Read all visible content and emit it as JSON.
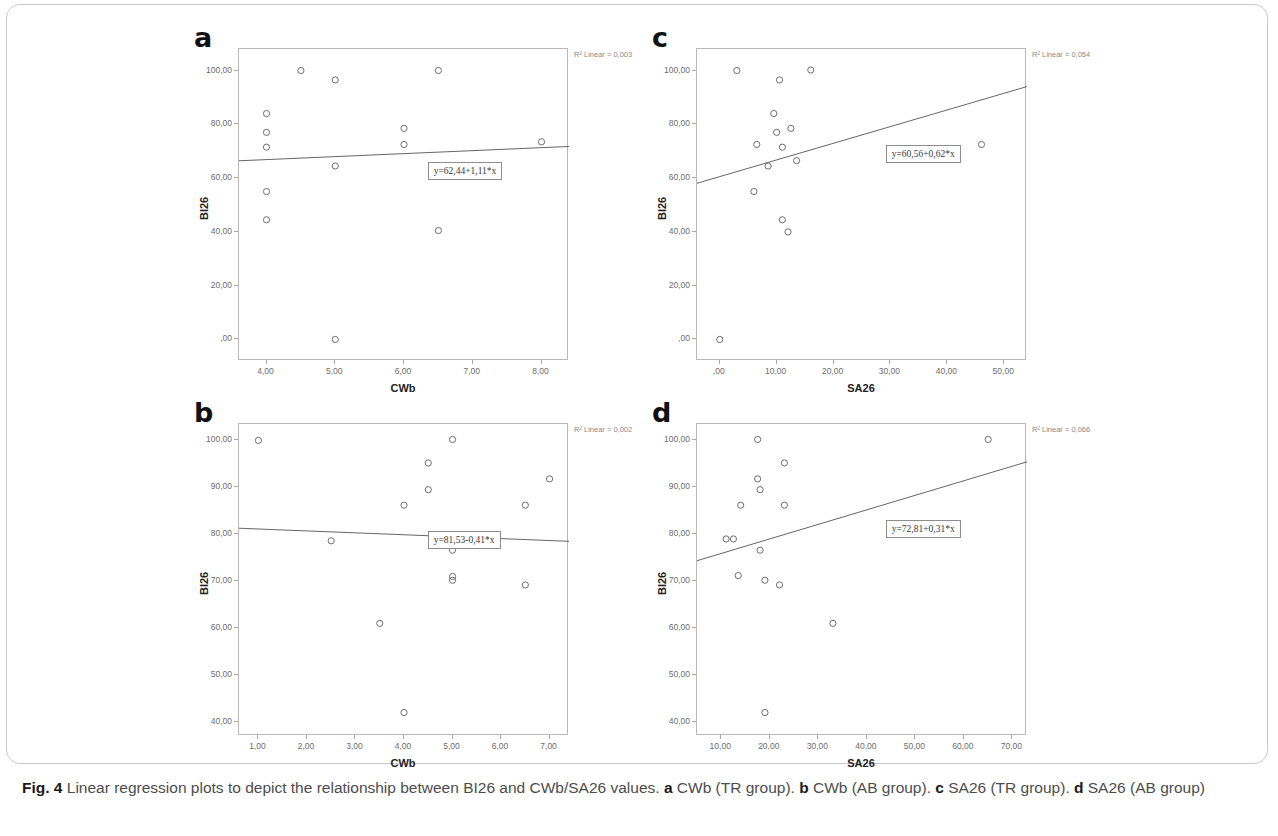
{
  "figure": {
    "label": "Fig. 4",
    "caption_main": "Linear regression plots to depict the relationship between BI26 and CWb/SA26 values.",
    "caption_parts": [
      {
        "letter": "a",
        "text": "CWb (TR group)."
      },
      {
        "letter": "b",
        "text": "CWb (AB group)."
      },
      {
        "letter": "c",
        "text": "SA26 (TR group)."
      },
      {
        "letter": "d",
        "text": "SA26 (AB group)"
      }
    ]
  },
  "chart_data": [
    {
      "panel": "a",
      "type": "scatter",
      "title": "",
      "xlabel": "CWb",
      "ylabel": "BI26",
      "xlim": [
        3.6,
        8.4
      ],
      "ylim": [
        -8.0,
        108.0
      ],
      "xticks": [
        "4,00",
        "5,00",
        "6,00",
        "7,00",
        "8,00"
      ],
      "xtick_values": [
        4,
        5,
        6,
        7,
        8
      ],
      "yticks": [
        "100,00",
        "80,00",
        "60,00",
        "40,00",
        "20,00",
        ",00"
      ],
      "ytick_values": [
        100,
        80,
        60,
        40,
        20,
        0
      ],
      "grid": false,
      "r2_label": "R² Linear = 0,003",
      "equation": "y=62,44+1,11*x",
      "fit": {
        "intercept": 62.44,
        "slope": 1.11
      },
      "points": [
        {
          "x": 4.0,
          "y": 84.0
        },
        {
          "x": 4.0,
          "y": 77.0
        },
        {
          "x": 4.0,
          "y": 71.5
        },
        {
          "x": 4.0,
          "y": 55.0
        },
        {
          "x": 4.0,
          "y": 44.5
        },
        {
          "x": 4.5,
          "y": 100.0
        },
        {
          "x": 5.0,
          "y": 96.5
        },
        {
          "x": 5.0,
          "y": 64.5
        },
        {
          "x": 5.0,
          "y": 0.0
        },
        {
          "x": 6.0,
          "y": 78.5
        },
        {
          "x": 6.0,
          "y": 72.5
        },
        {
          "x": 6.5,
          "y": 100.0
        },
        {
          "x": 6.5,
          "y": 40.5
        },
        {
          "x": 8.0,
          "y": 73.5
        }
      ]
    },
    {
      "panel": "b",
      "type": "scatter",
      "title": "",
      "xlabel": "CWb",
      "ylabel": "BI26",
      "xlim": [
        0.6,
        7.4
      ],
      "ylim": [
        37.0,
        103.5
      ],
      "xticks": [
        "1,00",
        "2,00",
        "3,00",
        "4,00",
        "5,00",
        "6,00",
        "7,00"
      ],
      "xtick_values": [
        1,
        2,
        3,
        4,
        5,
        6,
        7
      ],
      "yticks": [
        "100,00",
        "90,00",
        "80,00",
        "70,00",
        "60,00",
        "50,00",
        "40,00"
      ],
      "ytick_values": [
        100,
        90,
        80,
        70,
        60,
        50,
        40
      ],
      "grid": false,
      "r2_label": "R² Linear = 0,002",
      "equation": "y=81,53-0,41*x",
      "fit": {
        "intercept": 81.53,
        "slope": -0.41
      },
      "points": [
        {
          "x": 1.0,
          "y": 100.0
        },
        {
          "x": 2.5,
          "y": 78.6
        },
        {
          "x": 3.5,
          "y": 61.0
        },
        {
          "x": 4.0,
          "y": 86.2
        },
        {
          "x": 4.0,
          "y": 42.0
        },
        {
          "x": 4.5,
          "y": 95.2
        },
        {
          "x": 4.5,
          "y": 89.5
        },
        {
          "x": 5.0,
          "y": 100.2
        },
        {
          "x": 5.0,
          "y": 76.6
        },
        {
          "x": 5.0,
          "y": 71.0
        },
        {
          "x": 5.0,
          "y": 70.2
        },
        {
          "x": 6.5,
          "y": 86.2
        },
        {
          "x": 6.5,
          "y": 69.2
        },
        {
          "x": 7.0,
          "y": 91.8
        }
      ]
    },
    {
      "panel": "c",
      "type": "scatter",
      "title": "",
      "xlabel": "SA26",
      "ylabel": "BI26",
      "xlim": [
        -4.0,
        54.0
      ],
      "ylim": [
        -8.0,
        108.0
      ],
      "xticks": [
        ",00",
        "10,00",
        "20,00",
        "30,00",
        "40,00",
        "50,00"
      ],
      "xtick_values": [
        0,
        10,
        20,
        30,
        40,
        50
      ],
      "yticks": [
        "100,00",
        "80,00",
        "60,00",
        "40,00",
        "20,00",
        ",00"
      ],
      "ytick_values": [
        100,
        80,
        60,
        40,
        20,
        0
      ],
      "grid": false,
      "r2_label": "R² Linear = 0,054",
      "equation": "y=60,56+0,62*x",
      "fit": {
        "intercept": 60.56,
        "slope": 0.62
      },
      "points": [
        {
          "x": 0.0,
          "y": 0.0
        },
        {
          "x": 3.0,
          "y": 100.0
        },
        {
          "x": 6.5,
          "y": 72.5
        },
        {
          "x": 6.0,
          "y": 55.0
        },
        {
          "x": 8.5,
          "y": 64.5
        },
        {
          "x": 9.5,
          "y": 84.0
        },
        {
          "x": 10.0,
          "y": 77.0
        },
        {
          "x": 10.5,
          "y": 96.5
        },
        {
          "x": 11.0,
          "y": 71.5
        },
        {
          "x": 11.0,
          "y": 44.5
        },
        {
          "x": 12.0,
          "y": 40.0
        },
        {
          "x": 12.5,
          "y": 78.5
        },
        {
          "x": 13.5,
          "y": 66.5
        },
        {
          "x": 16.0,
          "y": 100.2
        },
        {
          "x": 46.0,
          "y": 72.5
        }
      ]
    },
    {
      "panel": "d",
      "type": "scatter",
      "title": "",
      "xlabel": "SA26",
      "ylabel": "BI26",
      "xlim": [
        5.0,
        73.0
      ],
      "ylim": [
        37.0,
        103.5
      ],
      "xticks": [
        "10,00",
        "20,00",
        "30,00",
        "40,00",
        "50,00",
        "60,00",
        "70,00"
      ],
      "xtick_values": [
        10,
        20,
        30,
        40,
        50,
        60,
        70
      ],
      "yticks": [
        "100,00",
        "90,00",
        "80,00",
        "70,00",
        "60,00",
        "50,00",
        "40,00"
      ],
      "ytick_values": [
        100,
        90,
        80,
        70,
        60,
        50,
        40
      ],
      "grid": false,
      "r2_label": "R² Linear = 0,066",
      "equation": "y=72,81+0,31*x",
      "fit": {
        "intercept": 72.81,
        "slope": 0.31
      },
      "points": [
        {
          "x": 11.0,
          "y": 79.0
        },
        {
          "x": 12.5,
          "y": 79.0
        },
        {
          "x": 13.5,
          "y": 71.2
        },
        {
          "x": 14.0,
          "y": 86.2
        },
        {
          "x": 17.5,
          "y": 100.2
        },
        {
          "x": 17.5,
          "y": 91.8
        },
        {
          "x": 18.0,
          "y": 89.5
        },
        {
          "x": 18.0,
          "y": 76.6
        },
        {
          "x": 19.0,
          "y": 70.2
        },
        {
          "x": 19.0,
          "y": 42.0
        },
        {
          "x": 22.0,
          "y": 69.2
        },
        {
          "x": 23.0,
          "y": 95.2
        },
        {
          "x": 23.0,
          "y": 86.2
        },
        {
          "x": 33.0,
          "y": 61.0
        },
        {
          "x": 65.0,
          "y": 100.2
        }
      ]
    }
  ]
}
